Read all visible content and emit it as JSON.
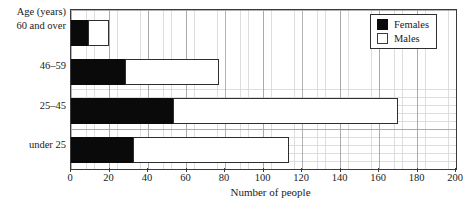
{
  "chart_data": {
    "type": "bar",
    "orientation": "horizontal",
    "stacked": true,
    "title": "",
    "xlabel": "Number of people",
    "ylabel": "Age (years)",
    "xlim": [
      0,
      200
    ],
    "xticks": [
      0,
      20,
      40,
      60,
      80,
      100,
      120,
      140,
      160,
      180,
      200
    ],
    "grid": true,
    "legend_position": "top-right",
    "categories": [
      "60 and over",
      "46–59",
      "25–45",
      "under 25"
    ],
    "series": [
      {
        "name": "Females",
        "color": "#0a0a0a",
        "values": [
          9,
          28,
          53,
          32
        ]
      },
      {
        "name": "Males",
        "color": "#ffffff",
        "values": [
          11,
          49,
          117,
          81
        ]
      }
    ],
    "totals": [
      20,
      77,
      170,
      113
    ]
  },
  "legend": {
    "items": [
      {
        "label": "Females",
        "swatch": "filled-black-square"
      },
      {
        "label": "Males",
        "swatch": "open-white-square"
      }
    ]
  },
  "axes": {
    "y_axis_title": "Age (years)",
    "x_axis_title": "Number of people",
    "x_tick_labels": [
      "0",
      "20",
      "40",
      "60",
      "80",
      "100",
      "120",
      "140",
      "160",
      "180",
      "200"
    ],
    "y_tick_labels": [
      "60 and over",
      "46–59",
      "25–45",
      "under 25"
    ]
  }
}
